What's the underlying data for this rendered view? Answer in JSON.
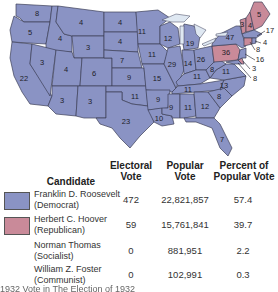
{
  "map": {
    "title": "Election of 1932",
    "colors": {
      "democrat": "#8a93c4",
      "republican": "#c98a99",
      "border": "#3c3f58"
    },
    "states": [
      {
        "abbr": "WA",
        "ev": "8",
        "party": "democrat"
      },
      {
        "abbr": "OR",
        "ev": "5",
        "party": "democrat"
      },
      {
        "abbr": "CA",
        "ev": "22",
        "party": "democrat"
      },
      {
        "abbr": "ID",
        "ev": "4",
        "party": "democrat"
      },
      {
        "abbr": "NV",
        "ev": "3",
        "party": "democrat"
      },
      {
        "abbr": "MT",
        "ev": "4",
        "party": "democrat"
      },
      {
        "abbr": "WY",
        "ev": "3",
        "party": "democrat"
      },
      {
        "abbr": "UT",
        "ev": "4",
        "party": "democrat"
      },
      {
        "abbr": "AZ",
        "ev": "3",
        "party": "democrat"
      },
      {
        "abbr": "CO",
        "ev": "6",
        "party": "democrat"
      },
      {
        "abbr": "NM",
        "ev": "3",
        "party": "democrat"
      },
      {
        "abbr": "ND",
        "ev": "4",
        "party": "democrat"
      },
      {
        "abbr": "SD",
        "ev": "4",
        "party": "democrat"
      },
      {
        "abbr": "NE",
        "ev": "7",
        "party": "democrat"
      },
      {
        "abbr": "KS",
        "ev": "9",
        "party": "democrat"
      },
      {
        "abbr": "OK",
        "ev": "11",
        "party": "democrat"
      },
      {
        "abbr": "TX",
        "ev": "23",
        "party": "democrat"
      },
      {
        "abbr": "MN",
        "ev": "11",
        "party": "democrat"
      },
      {
        "abbr": "IA",
        "ev": "11",
        "party": "democrat"
      },
      {
        "abbr": "MO",
        "ev": "15",
        "party": "democrat"
      },
      {
        "abbr": "AR",
        "ev": "9",
        "party": "democrat"
      },
      {
        "abbr": "LA",
        "ev": "10",
        "party": "democrat"
      },
      {
        "abbr": "WI",
        "ev": "12",
        "party": "democrat"
      },
      {
        "abbr": "IL",
        "ev": "29",
        "party": "democrat"
      },
      {
        "abbr": "MI",
        "ev": "19",
        "party": "democrat"
      },
      {
        "abbr": "IN",
        "ev": "14",
        "party": "democrat"
      },
      {
        "abbr": "OH",
        "ev": "26",
        "party": "democrat"
      },
      {
        "abbr": "KY",
        "ev": "11",
        "party": "democrat"
      },
      {
        "abbr": "TN",
        "ev": "11",
        "party": "democrat"
      },
      {
        "abbr": "MS",
        "ev": "9",
        "party": "democrat"
      },
      {
        "abbr": "AL",
        "ev": "11",
        "party": "democrat"
      },
      {
        "abbr": "GA",
        "ev": "12",
        "party": "democrat"
      },
      {
        "abbr": "FL",
        "ev": "7",
        "party": "democrat"
      },
      {
        "abbr": "SC",
        "ev": "8",
        "party": "democrat"
      },
      {
        "abbr": "NC",
        "ev": "13",
        "party": "democrat"
      },
      {
        "abbr": "VA",
        "ev": "11",
        "party": "democrat"
      },
      {
        "abbr": "WV",
        "ev": "8",
        "party": "democrat"
      },
      {
        "abbr": "PA",
        "ev": "36",
        "party": "republican"
      },
      {
        "abbr": "NY",
        "ev": "47",
        "party": "democrat"
      },
      {
        "abbr": "ME",
        "ev": "5",
        "party": "republican"
      },
      {
        "abbr": "NH",
        "ev": "4",
        "party": "republican"
      },
      {
        "abbr": "VT",
        "ev": "3",
        "party": "republican"
      },
      {
        "abbr": "MA",
        "ev": "17",
        "party": "democrat"
      },
      {
        "abbr": "RI",
        "ev": "4",
        "party": "democrat"
      },
      {
        "abbr": "CT",
        "ev": "8",
        "party": "republican"
      },
      {
        "abbr": "NJ",
        "ev": "16",
        "party": "democrat"
      },
      {
        "abbr": "DE",
        "ev": "3",
        "party": "republican"
      },
      {
        "abbr": "MD",
        "ev": "8",
        "party": "democrat"
      }
    ]
  },
  "table": {
    "headers": {
      "candidate": "Candidate",
      "electoral_1": "Electoral",
      "electoral_2": "Vote",
      "popular_1": "Popular",
      "popular_2": "Vote",
      "percent_1": "Percent of",
      "percent_2": "Popular Vote"
    },
    "rows": [
      {
        "name": "Franklin D. Roosevelt",
        "party": "(Democrat)",
        "electoral": "472",
        "popular": "22,821,857",
        "percent": "57.4",
        "swatch": "#8a93c4"
      },
      {
        "name": "Herbert C. Hoover",
        "party": "(Republican)",
        "electoral": "59",
        "popular": "15,761,841",
        "percent": "39.7",
        "swatch": "#c98a99"
      },
      {
        "name": "Norman Thomas",
        "party": "(Socialist)",
        "electoral": "0",
        "popular": "881,951",
        "percent": "2.2",
        "swatch": null
      },
      {
        "name": "William Z. Foster",
        "party": "(Communist)",
        "electoral": "0",
        "popular": "102,991",
        "percent": "0.3",
        "swatch": null
      }
    ]
  },
  "caption": "1932 Vote in The Election of 1932"
}
